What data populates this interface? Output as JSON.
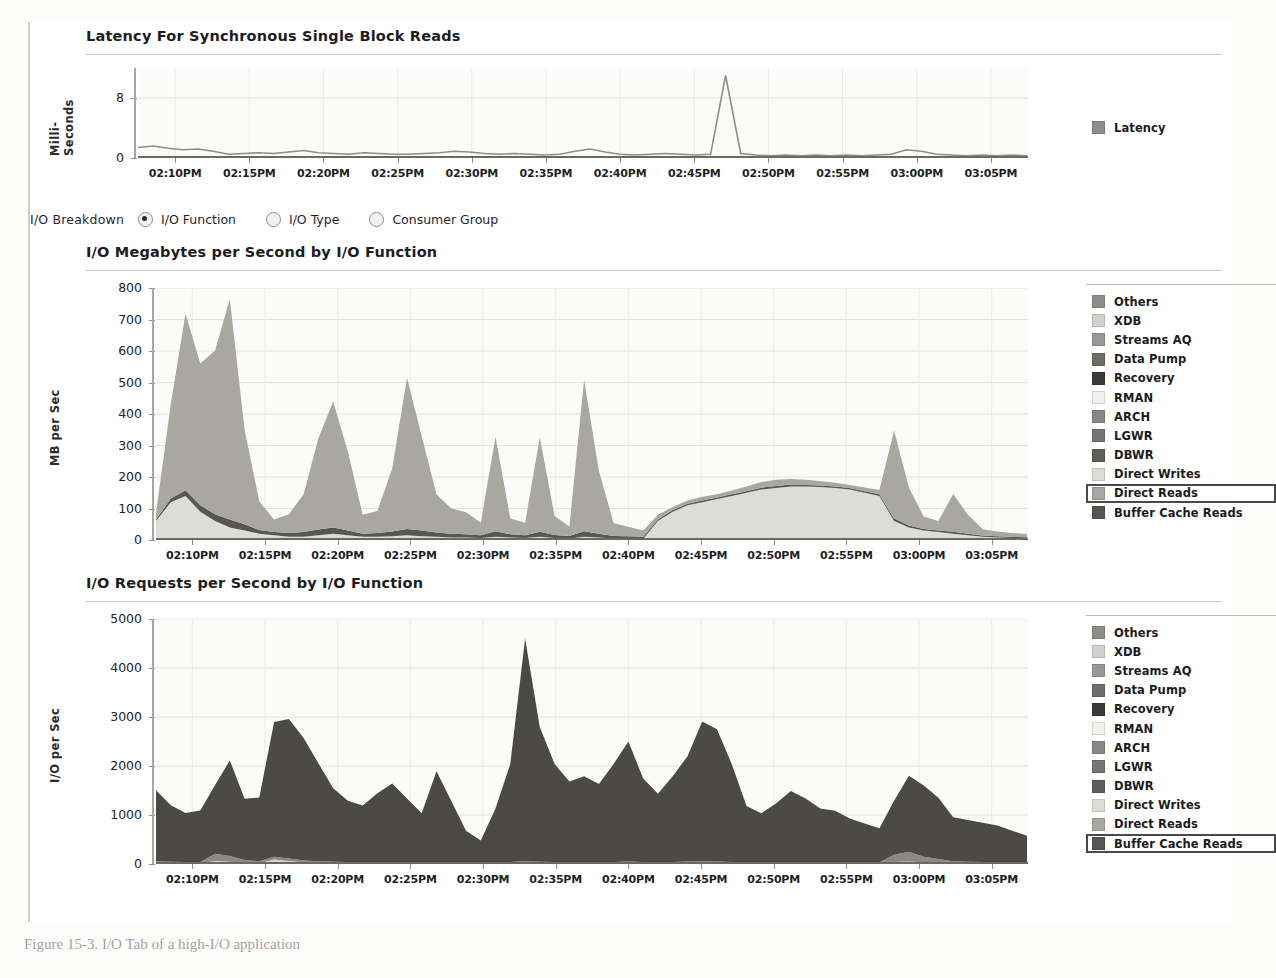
{
  "panels": {
    "latency": {
      "title": "Latency For Synchronous Single Block Reads",
      "ylabel": "Milli-Seconds",
      "yticks": [
        "8",
        "0"
      ],
      "legend": [
        {
          "label": "Latency",
          "color": "#8f8d88"
        }
      ]
    },
    "breakdown_controls": {
      "label": "I/O Breakdown",
      "options": [
        {
          "label": "I/O Function",
          "selected": true
        },
        {
          "label": "I/O Type",
          "selected": false
        },
        {
          "label": "Consumer Group",
          "selected": false
        }
      ]
    },
    "mbps": {
      "title": "I/O Megabytes per Second by I/O Function",
      "ylabel": "MB per Sec",
      "highlight": "Direct Reads"
    },
    "iops": {
      "title": "I/O Requests per Second by I/O Function",
      "ylabel": "I/O per Sec",
      "highlight": "Buffer Cache Reads"
    }
  },
  "legend_series": [
    {
      "label": "Others",
      "color": "#8e8c87"
    },
    {
      "label": "XDB",
      "color": "#d3d1cc"
    },
    {
      "label": "Streams AQ",
      "color": "#9a9893"
    },
    {
      "label": "Data Pump",
      "color": "#6f6d69"
    },
    {
      "label": "Recovery",
      "color": "#3a3936"
    },
    {
      "label": "RMAN",
      "color": "#f2f1ee"
    },
    {
      "label": "ARCH",
      "color": "#8a8883"
    },
    {
      "label": "LGWR",
      "color": "#76746f"
    },
    {
      "label": "DBWR",
      "color": "#605e5a"
    },
    {
      "label": "Direct Writes",
      "color": "#ddddd8"
    },
    {
      "label": "Direct Reads",
      "color": "#a9a7a2"
    },
    {
      "label": "Buffer Cache Reads",
      "color": "#585652"
    }
  ],
  "xticks": [
    "02:10PM",
    "02:15PM",
    "02:20PM",
    "02:25PM",
    "02:30PM",
    "02:35PM",
    "02:40PM",
    "02:45PM",
    "02:50PM",
    "02:55PM",
    "03:00PM",
    "03:05PM"
  ],
  "caption": "Figure 15-3.  I/O Tab of a high-I/O application",
  "bleed_text": [
    "sort operations or a data warehouse query. Most of the time, A",
    "way, giving vital information about... ARCH  recovery  XDB  Stre",
    "is the graph with the I/O breakdown.",
    "Listed next in the I/O tab are the I/O rates and the I/O functions",
    "I/O per second and the megabytes per second are the main met",
    "The screen in Figure 15-3 shows a graph of these I/O breakdo",
    "there are extremely high I/O rates for this database.",
    "of the I/O is reads and a few writes, but there is also a spike in",
    "I/O Tab of a high-I/O application",
    "This tab also contains a listing of I/O calibration values and",
    "and configuration of the database I/O subsystem.",
    "Performance Home Page",
    "The Performance Home Page is a comprehensive summary of",
    "which shows CPU, memory, and I/O usage across the databa",
    "Click the Performance tab from the Database Home Page to a",
    "Figure 15-4 shows a sample of a typical configuration."
  ],
  "chart_data": [
    {
      "type": "line",
      "title": "Latency For Synchronous Single Block Reads",
      "xlabel": "",
      "ylabel": "Milli-Seconds",
      "ylim": [
        0,
        12
      ],
      "yticks": [
        0,
        8
      ],
      "grid": true,
      "legend_position": "right",
      "x": [
        "02:10PM",
        "02:15PM",
        "02:20PM",
        "02:25PM",
        "02:30PM",
        "02:35PM",
        "02:40PM",
        "02:45PM",
        "02:50PM",
        "02:55PM",
        "03:00PM",
        "03:05PM"
      ],
      "series": [
        {
          "name": "Latency",
          "color": "#8f8d88",
          "values": [
            1.4,
            1.6,
            1.3,
            1.1,
            1.2,
            0.9,
            0.5,
            0.6,
            0.7,
            0.6,
            0.8,
            1.0,
            0.7,
            0.6,
            0.5,
            0.7,
            0.6,
            0.5,
            0.5,
            0.6,
            0.7,
            0.9,
            0.8,
            0.6,
            0.5,
            0.6,
            0.5,
            0.4,
            0.5,
            0.9,
            1.2,
            0.8,
            0.5,
            0.4,
            0.5,
            0.6,
            0.5,
            0.4,
            0.5,
            11.0,
            0.6,
            0.4,
            0.3,
            0.4,
            0.3,
            0.4,
            0.3,
            0.4,
            0.3,
            0.4,
            0.5,
            1.1,
            0.9,
            0.5,
            0.4,
            0.3,
            0.4,
            0.3,
            0.4,
            0.3
          ]
        }
      ]
    },
    {
      "type": "area",
      "title": "I/O Megabytes per Second by I/O Function",
      "xlabel": "",
      "ylabel": "MB per Sec",
      "ylim": [
        0,
        800
      ],
      "yticks": [
        0,
        100,
        200,
        300,
        400,
        500,
        600,
        700,
        800
      ],
      "grid": true,
      "stacked": true,
      "legend_position": "right",
      "x": [
        "02:10PM",
        "02:15PM",
        "02:20PM",
        "02:25PM",
        "02:30PM",
        "02:35PM",
        "02:40PM",
        "02:45PM",
        "02:50PM",
        "02:55PM",
        "03:00PM",
        "03:05PM"
      ],
      "series": [
        {
          "name": "Direct Reads",
          "color": "#a9a7a2",
          "values": [
            20,
            300,
            560,
            450,
            520,
            700,
            300,
            90,
            40,
            60,
            120,
            290,
            400,
            250,
            60,
            70,
            200,
            480,
            300,
            120,
            80,
            70,
            40,
            300,
            50,
            40,
            300,
            60,
            30,
            480,
            200,
            40,
            30,
            20,
            15,
            10,
            10,
            12,
            10,
            12,
            15,
            18,
            20,
            18,
            16,
            14,
            12,
            10,
            12,
            14,
            280,
            120,
            40,
            30,
            120,
            60,
            20,
            15,
            12,
            10
          ]
        },
        {
          "name": "Buffer Cache Reads",
          "color": "#585652",
          "values": [
            5,
            12,
            18,
            20,
            22,
            25,
            20,
            12,
            10,
            12,
            15,
            18,
            20,
            15,
            10,
            12,
            15,
            20,
            18,
            14,
            12,
            10,
            9,
            18,
            10,
            9,
            16,
            10,
            8,
            18,
            12,
            8,
            7,
            6,
            5,
            5,
            5,
            5,
            5,
            5,
            5,
            6,
            6,
            6,
            5,
            5,
            5,
            5,
            5,
            5,
            8,
            6,
            5,
            5,
            6,
            5,
            4,
            4,
            4,
            4
          ]
        },
        {
          "name": "Direct Writes",
          "color": "#ddddd8",
          "values": [
            60,
            120,
            140,
            90,
            60,
            40,
            30,
            20,
            15,
            10,
            10,
            15,
            20,
            15,
            10,
            10,
            12,
            15,
            12,
            10,
            8,
            8,
            6,
            10,
            8,
            6,
            10,
            6,
            5,
            10,
            8,
            5,
            5,
            4,
            60,
            90,
            110,
            120,
            130,
            140,
            150,
            160,
            165,
            170,
            170,
            168,
            165,
            160,
            150,
            140,
            60,
            40,
            30,
            25,
            20,
            15,
            10,
            8,
            6,
            5
          ]
        }
      ]
    },
    {
      "type": "area",
      "title": "I/O Requests per Second by I/O Function",
      "xlabel": "",
      "ylabel": "I/O per Sec",
      "ylim": [
        0,
        5000
      ],
      "yticks": [
        0,
        1000,
        2000,
        3000,
        4000,
        5000
      ],
      "grid": true,
      "stacked": true,
      "legend_position": "right",
      "x": [
        "02:10PM",
        "02:15PM",
        "02:20PM",
        "02:25PM",
        "02:30PM",
        "02:35PM",
        "02:40PM",
        "02:45PM",
        "02:50PM",
        "02:55PM",
        "03:00PM",
        "03:05PM"
      ],
      "series": [
        {
          "name": "Buffer Cache Reads",
          "color": "#4c4a47",
          "values": [
            1450,
            1150,
            1000,
            1050,
            1400,
            1950,
            1250,
            1300,
            2750,
            2850,
            2500,
            2000,
            1500,
            1250,
            1150,
            1400,
            1600,
            1300,
            1000,
            1850,
            1250,
            650,
            450,
            1100,
            2000,
            4550,
            2750,
            2000,
            1650,
            1750,
            1600,
            2000,
            2450,
            1700,
            1400,
            1750,
            2150,
            2850,
            2700,
            2000,
            1150,
            1000,
            1200,
            1450,
            1300,
            1100,
            1050,
            900,
            800,
            700,
            1100,
            1550,
            1450,
            1250,
            900,
            850,
            800,
            750,
            650,
            550
          ]
        },
        {
          "name": "Direct Reads",
          "color": "#8b8984",
          "values": [
            40,
            35,
            30,
            30,
            150,
            120,
            60,
            40,
            60,
            50,
            40,
            35,
            30,
            30,
            30,
            30,
            30,
            25,
            25,
            30,
            25,
            20,
            20,
            25,
            30,
            40,
            35,
            30,
            25,
            30,
            25,
            30,
            35,
            30,
            25,
            30,
            35,
            40,
            35,
            30,
            25,
            25,
            25,
            30,
            25,
            25,
            25,
            20,
            20,
            20,
            150,
            200,
            120,
            80,
            40,
            35,
            30,
            25,
            20,
            20
          ]
        },
        {
          "name": "Direct Writes",
          "color": "#d6d4cf",
          "values": [
            15,
            12,
            10,
            10,
            60,
            45,
            20,
            15,
            90,
            60,
            30,
            20,
            15,
            12,
            12,
            12,
            12,
            10,
            10,
            12,
            10,
            8,
            8,
            10,
            12,
            15,
            12,
            10,
            10,
            12,
            10,
            12,
            14,
            12,
            10,
            12,
            14,
            16,
            14,
            12,
            10,
            10,
            10,
            12,
            10,
            10,
            10,
            8,
            8,
            8,
            40,
            50,
            30,
            20,
            15,
            12,
            10,
            8,
            8,
            8
          ]
        }
      ]
    }
  ]
}
